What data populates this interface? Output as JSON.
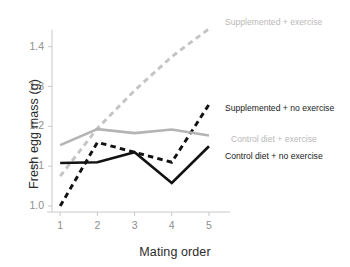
{
  "chart_data": {
    "type": "line",
    "title": "",
    "xlabel": "Mating order",
    "ylabel": "Fresh egg mass (g)",
    "x": [
      1,
      2,
      3,
      4,
      5
    ],
    "xtick_labels": [
      "1",
      "2",
      "3",
      "4",
      "5"
    ],
    "ytick_labels": [
      "1.0",
      "1.1",
      "1.2",
      "1.3",
      "1.4"
    ],
    "ytick_values": [
      1.0,
      1.1,
      1.2,
      1.3,
      1.4
    ],
    "xlim": [
      0.78,
      5.35
    ],
    "ylim": [
      0.975,
      1.462
    ],
    "grid": false,
    "legend_position": "inline-right-of-line-ends",
    "series": [
      {
        "name": "Supplemented + exercise",
        "values": [
          1.075,
          1.195,
          1.29,
          1.375,
          1.445
        ],
        "color": "#c4c4c4",
        "style": "dashed",
        "label": "Supplemented + exercise",
        "label_x": 225,
        "label_y": 17
      },
      {
        "name": "Supplemented + no exercise",
        "values": [
          1.0,
          1.16,
          1.135,
          1.11,
          1.255
        ],
        "color": "#121212",
        "style": "dashed",
        "label": "Supplemented + no exercise",
        "label_x": 225,
        "label_y": 103
      },
      {
        "name": "Control diet + exercise",
        "values": [
          1.153,
          1.193,
          1.183,
          1.192,
          1.177
        ],
        "color": "#b4b4b4",
        "style": "solid",
        "label": "Control diet + exercise",
        "label_x": 231,
        "label_y": 134
      },
      {
        "name": "Control diet + no exercise",
        "values": [
          1.108,
          1.11,
          1.135,
          1.058,
          1.15
        ],
        "color": "#121212",
        "style": "solid",
        "label": "Control diet + no exercise",
        "label_x": 225,
        "label_y": 151
      }
    ],
    "axis_color": "#c9c9c9",
    "tick_text_color": "#8e8e8e",
    "axis_title_color": "#2b2b2b"
  }
}
